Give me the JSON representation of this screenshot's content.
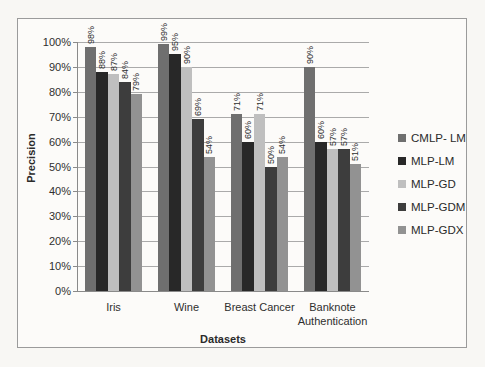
{
  "chart_data": {
    "type": "bar",
    "title": "",
    "xlabel": "Datasets",
    "ylabel": "Precision",
    "categories": [
      "Iris",
      "Wine",
      "Breast Cancer",
      "Banknote Authentication"
    ],
    "series": [
      {
        "name": "CMLP- LM",
        "color": "#6f6f6f",
        "values": [
          98,
          99,
          71,
          90
        ]
      },
      {
        "name": "MLP-LM",
        "color": "#282828",
        "values": [
          88,
          95,
          60,
          60
        ]
      },
      {
        "name": "MLP-GD",
        "color": "#bfbfbf",
        "values": [
          87,
          90,
          71,
          57
        ]
      },
      {
        "name": "MLP-GDM",
        "color": "#3d3d3d",
        "values": [
          84,
          69,
          50,
          57
        ]
      },
      {
        "name": "MLP-GDX",
        "color": "#929292",
        "values": [
          79,
          54,
          54,
          51
        ]
      }
    ],
    "ylim": [
      0,
      100
    ],
    "ytick_step": 10,
    "ytick_labels": [
      "0%",
      "10%",
      "20%",
      "30%",
      "40%",
      "50%",
      "60%",
      "70%",
      "80%",
      "90%",
      "100%"
    ],
    "data_label_format": "percent",
    "data_labels_rotated": true,
    "grid": true,
    "legend_position": "right",
    "colors": {
      "gridline": "#aaaaaa",
      "axis": "#8a8a8a",
      "frame_border": "#9b9b9b",
      "text": "#2f2f2f"
    }
  }
}
